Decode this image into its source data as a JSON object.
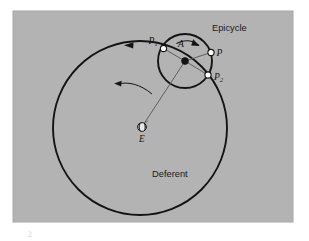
{
  "figure": {
    "kind": "astronomy-diagram",
    "background_color": "#ffffff",
    "panel_color": "#b3b3b3",
    "panel_border_color": "#a6a6a6",
    "ink_color": "#141414",
    "thin_line_color": "#555555",
    "marker_fill": "#ffffff",
    "marker_stroke": "#141414",
    "hub_fill": "#141414",
    "labels": {
      "epicycle": "Epicycle",
      "deferent": "Deferent",
      "center_epicycle": "A",
      "planet": "P",
      "point_one_base": "P",
      "point_one_sub": "1",
      "point_two_base": "P",
      "point_two_sub": "2",
      "earth": "E"
    },
    "geometry": {
      "panel": {
        "x": 13,
        "y": 11,
        "width": 280,
        "height": 211
      },
      "deferent": {
        "cx": 140,
        "cy": 128,
        "r": 87
      },
      "epicycle": {
        "cx": 185,
        "cy": 61,
        "r": 27
      },
      "earth": {
        "cx": 142,
        "cy": 128,
        "r": 4.2
      },
      "point_P1": {
        "cx": 163.5,
        "cy": 48.5,
        "r": 3.1
      },
      "point_P": {
        "cx": 211,
        "cy": 52.5,
        "r": 3.1
      },
      "point_P2": {
        "cx": 208,
        "cy": 75,
        "r": 3.1
      },
      "hub_A": {
        "cx": 185,
        "cy": 61,
        "r": 3.4
      }
    },
    "caption_mark": "2"
  }
}
